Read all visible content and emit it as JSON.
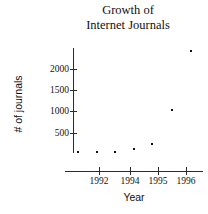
{
  "chart_data": {
    "type": "scatter",
    "title": "Growth of Internet Journals",
    "title_lines": [
      "Growth of",
      "Internet Journals"
    ],
    "xlabel": "Year",
    "ylabel": "# of journals",
    "grid": false,
    "legend": null,
    "x": [
      1991.3,
      1992.0,
      1992.6,
      1993.3,
      1993.9,
      1995.5,
      1996.2
    ],
    "values": [
      20,
      30,
      45,
      110,
      190,
      1080,
      2400
    ],
    "points": [
      {
        "x": 1991.3,
        "y": 20,
        "px": 78,
        "py": 152
      },
      {
        "x": 1992.0,
        "y": 30,
        "px": 97,
        "py": 152
      },
      {
        "x": 1992.6,
        "y": 45,
        "px": 115,
        "py": 152
      },
      {
        "x": 1993.3,
        "y": 110,
        "px": 134,
        "py": 149
      },
      {
        "x": 1993.9,
        "y": 190,
        "px": 152,
        "py": 144
      },
      {
        "x": 1995.5,
        "y": 1080,
        "px": 172,
        "py": 110
      },
      {
        "x": 1996.2,
        "y": 2400,
        "px": 191,
        "py": 51
      }
    ],
    "yticks": [
      {
        "label": "2000",
        "value": 2000,
        "py": 69
      },
      {
        "label": "1500",
        "value": 1500,
        "py": 90
      },
      {
        "label": "1000",
        "value": 1000,
        "py": 111
      },
      {
        "label": "500",
        "value": 500,
        "py": 133
      }
    ],
    "xticks": [
      {
        "label": "1992",
        "value": 1992,
        "px": 99
      },
      {
        "label": "1994",
        "value": 1994,
        "px": 130
      },
      {
        "label": "1995",
        "value": 1995,
        "px": 158
      },
      {
        "label": "1996",
        "value": 1996,
        "px": 186
      }
    ],
    "ylim": [
      0,
      2500
    ],
    "xlim": [
      1990.8,
      1996.6
    ],
    "colors": {
      "background": "#ffffff",
      "axis": "#2b2b2b",
      "marker": "#111111",
      "text": "#111111"
    }
  }
}
